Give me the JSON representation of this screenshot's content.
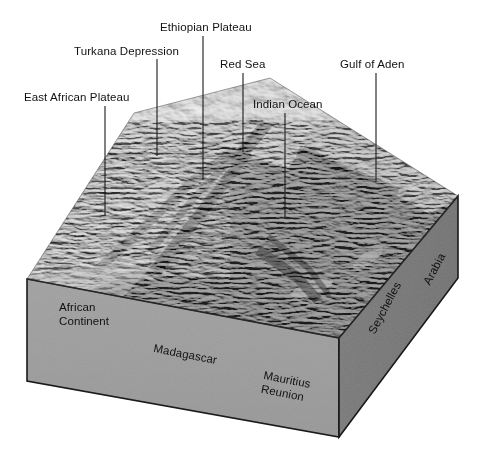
{
  "figure": {
    "background_color": "#ffffff",
    "text_color": "#111111",
    "front_face_color": "#9c9c9c",
    "right_face_color": "#787878",
    "edge_color": "#1a1a1a"
  },
  "callouts": [
    {
      "key": "east-african-plateau",
      "label": "East African Plateau",
      "label_x": 24,
      "label_y": 91,
      "line_x1": 105,
      "line_y1": 106,
      "line_x2": 105,
      "line_y2": 216
    },
    {
      "key": "turkana-depression",
      "label": "Turkana Depression",
      "label_x": 74,
      "label_y": 45,
      "line_x1": 157,
      "line_y1": 59,
      "line_x2": 157,
      "line_y2": 156
    },
    {
      "key": "ethiopian-plateau",
      "label": "Ethiopian Plateau",
      "label_x": 160,
      "label_y": 21,
      "line_x1": 203,
      "line_y1": 36,
      "line_x2": 203,
      "line_y2": 180
    },
    {
      "key": "red-sea",
      "label": "Red Sea",
      "label_x": 220,
      "label_y": 58,
      "line_x1": 243,
      "line_y1": 73,
      "line_x2": 243,
      "line_y2": 152
    },
    {
      "key": "indian-ocean",
      "label": "Indian Ocean",
      "label_x": 253,
      "label_y": 98,
      "line_x1": 285,
      "line_y1": 113,
      "line_x2": 285,
      "line_y2": 219
    },
    {
      "key": "gulf-of-aden",
      "label": "Gulf of Aden",
      "label_x": 340,
      "label_y": 58,
      "line_x1": 376,
      "line_y1": 73,
      "line_x2": 376,
      "line_y2": 182
    }
  ],
  "face_labels": [
    {
      "key": "african-continent",
      "label": "African\nContinent",
      "x": 59,
      "y": 301,
      "rotation_class": ""
    },
    {
      "key": "madagascar",
      "label": "Madagascar",
      "x": 155,
      "y": 342,
      "rotation_class": "rot-madagascar"
    },
    {
      "key": "mauritius-reunion",
      "label": "Mauritius\nReunion",
      "x": 265,
      "y": 369,
      "rotation_class": "rot-mauritius"
    },
    {
      "key": "seychelles",
      "label": "Seychelles",
      "x": 366,
      "y": 330,
      "rotation_class": "rot-seychelles"
    },
    {
      "key": "arabia",
      "label": "Arabia",
      "x": 421,
      "y": 281,
      "rotation_class": "rot-arabia"
    }
  ],
  "chart_data": {
    "type": "map",
    "projection": "oblique 3D block / shaded relief",
    "features_top_surface": [
      "East African Plateau",
      "Turkana Depression",
      "Ethiopian Plateau",
      "Red Sea",
      "Indian Ocean",
      "Gulf of Aden"
    ],
    "features_front_face": [
      "African Continent",
      "Madagascar",
      "Mauritius Reunion"
    ],
    "features_right_face": [
      "Seychelles",
      "Arabia"
    ],
    "block_corners": {
      "front_left_top": [
        27,
        279
      ],
      "front_right_top": [
        339,
        338
      ],
      "front_left_bottom": [
        27,
        381
      ],
      "front_right_bottom": [
        339,
        437
      ],
      "back_left_top": [
        27,
        279
      ],
      "right_far_top": [
        458,
        196
      ],
      "right_far_bottom": [
        458,
        278
      ]
    }
  }
}
